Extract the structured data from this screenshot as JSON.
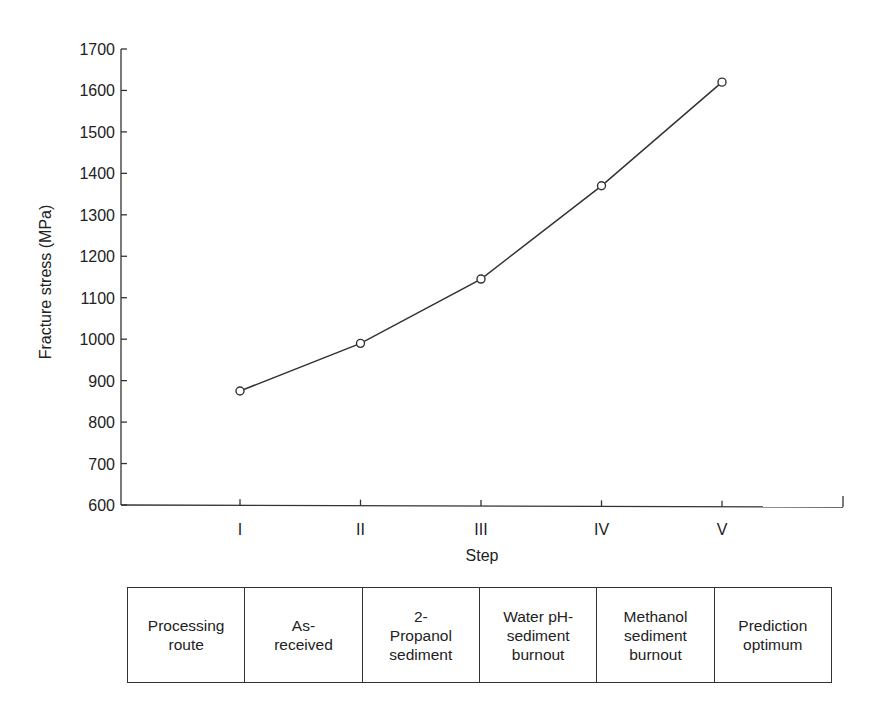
{
  "chart_data": {
    "type": "line",
    "title": "",
    "xlabel": "Step",
    "ylabel": "Fracture stress (MPa)",
    "categories": [
      "I",
      "II",
      "III",
      "IV",
      "V"
    ],
    "series": [
      {
        "name": "Fracture stress",
        "values": [
          875,
          990,
          1145,
          1370,
          1620
        ],
        "marker": "open-circle"
      }
    ],
    "ylim": [
      600,
      1700
    ],
    "yticks": [
      600,
      700,
      800,
      900,
      1000,
      1100,
      1200,
      1300,
      1400,
      1500,
      1600,
      1700
    ],
    "grid": false,
    "legend": null
  },
  "axes": {
    "x_label": "Step",
    "y_label": "Fracture stress (MPa)",
    "y_tick_labels": [
      "600",
      "700",
      "800",
      "900",
      "1000",
      "1100",
      "1200",
      "1300",
      "1400",
      "1500",
      "1600",
      "1700"
    ],
    "x_tick_labels": [
      "I",
      "II",
      "III",
      "IV",
      "V"
    ]
  },
  "route_table": {
    "cells": [
      "Processing\nroute",
      "As-\nreceived",
      "2-\nPropanol\nsediment",
      "Water pH-\nsediment\nburnout",
      "Methanol\nsediment\nburnout",
      "Prediction\noptimum"
    ]
  },
  "colors": {
    "line": "#333333",
    "axis": "#333333",
    "text": "#222222",
    "background": "#ffffff"
  }
}
